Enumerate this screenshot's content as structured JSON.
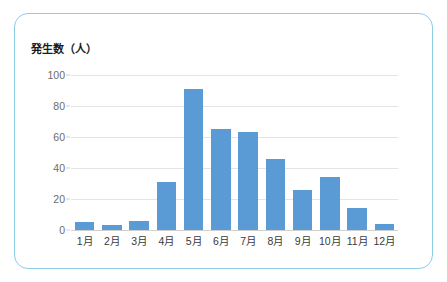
{
  "card": {
    "border_color": "#8ccde8",
    "background": "#ffffff"
  },
  "chart_data": {
    "type": "bar",
    "title": "発生数（人）",
    "xlabel": "",
    "ylabel": "発生数（人）",
    "categories": [
      "1月",
      "2月",
      "3月",
      "4月",
      "5月",
      "6月",
      "7月",
      "8月",
      "9月",
      "10月",
      "11月",
      "12月"
    ],
    "values": [
      5,
      3,
      6,
      31,
      91,
      65,
      63,
      46,
      26,
      34,
      14,
      4
    ],
    "yticks": [
      0,
      20,
      40,
      60,
      80,
      100
    ],
    "ytick_labels": [
      "0",
      "20",
      "40",
      "60",
      "80",
      "100"
    ],
    "ylim": [
      0,
      100
    ],
    "grid": true,
    "legend": false,
    "legend_position": "none",
    "bar_color": "#5b9bd5",
    "gridline_color": "#e4e4e4",
    "axis_color": "#cfcfcf"
  }
}
